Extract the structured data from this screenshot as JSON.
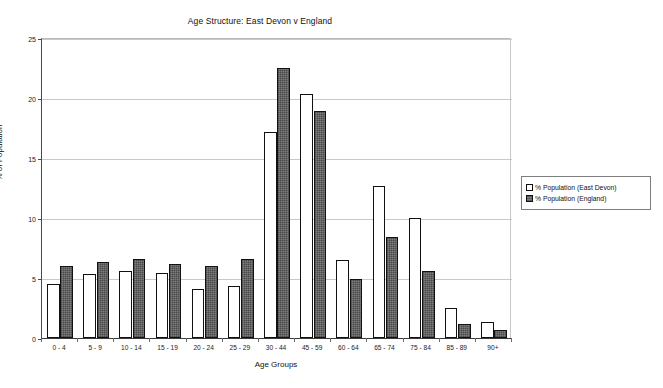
{
  "chart_data": {
    "type": "bar",
    "title": "Age Structure: East Devon v England",
    "xlabel": "Age Groups",
    "ylabel": "% of Population",
    "categories": [
      "0 - 4",
      "5 - 9",
      "10 - 14",
      "15 - 19",
      "20 - 24",
      "25 - 29",
      "30 - 44",
      "45 - 59",
      "60 - 64",
      "65 - 74",
      "75 - 84",
      "85 - 89",
      "90+"
    ],
    "series": [
      {
        "name": "% Population (East Devon)",
        "color": "#ffffff",
        "values": [
          4.5,
          5.3,
          5.6,
          5.4,
          4.1,
          4.3,
          17.2,
          20.3,
          6.5,
          12.7,
          10.0,
          2.5,
          1.3
        ]
      },
      {
        "name": "% Population (England)",
        "color": "#7d7d7d",
        "values": [
          6.0,
          6.3,
          6.6,
          6.2,
          6.0,
          6.6,
          22.5,
          18.9,
          4.9,
          8.4,
          5.6,
          1.2,
          0.7
        ]
      }
    ],
    "ylim": [
      0,
      25
    ],
    "yticks": [
      0,
      5,
      10,
      15,
      20,
      25
    ],
    "ytick_labels": [
      "0",
      "5",
      "10",
      "15",
      "20",
      "25"
    ],
    "grid": true,
    "legend_position": "right"
  },
  "legend": {
    "entries": [
      {
        "label": "% Population (East Devon)"
      },
      {
        "label": "% Population (England)"
      }
    ]
  }
}
